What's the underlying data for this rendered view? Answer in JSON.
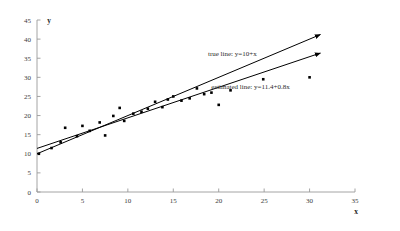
{
  "chart_data": {
    "type": "scatter",
    "title": "",
    "xlabel": "x",
    "ylabel": "y",
    "xlim": [
      0,
      35
    ],
    "ylim": [
      0,
      45
    ],
    "xticks": [
      0,
      5,
      10,
      15,
      20,
      25,
      30,
      35
    ],
    "yticks": [
      0,
      5,
      10,
      15,
      20,
      25,
      30,
      35,
      40,
      45
    ],
    "grid": false,
    "legend_position": "inline-annotations",
    "annotations": [
      {
        "name": "true-line-label",
        "text": "true line: y=10+x",
        "x": 21.5,
        "y": 35.5
      },
      {
        "name": "estimated-line-label",
        "text": "estimated line: y=11.4+0.8x",
        "x": 23.5,
        "y": 27.0
      }
    ],
    "series": [
      {
        "name": "observations",
        "type": "scatter",
        "marker": "square",
        "color": "#000000",
        "points": [
          [
            0.2,
            10.0
          ],
          [
            1.6,
            11.5
          ],
          [
            2.6,
            13.0
          ],
          [
            3.1,
            16.8
          ],
          [
            4.4,
            14.6
          ],
          [
            5.0,
            17.3
          ],
          [
            5.8,
            16.0
          ],
          [
            6.9,
            18.2
          ],
          [
            7.5,
            14.8
          ],
          [
            8.4,
            19.9
          ],
          [
            9.1,
            22.0
          ],
          [
            9.6,
            18.6
          ],
          [
            10.6,
            20.5
          ],
          [
            11.5,
            21.0
          ],
          [
            12.2,
            21.8
          ],
          [
            13.0,
            23.6
          ],
          [
            13.8,
            22.2
          ],
          [
            14.4,
            24.2
          ],
          [
            15.0,
            25.0
          ],
          [
            15.9,
            23.9
          ],
          [
            16.8,
            24.5
          ],
          [
            17.6,
            27.1
          ],
          [
            18.4,
            25.6
          ],
          [
            19.2,
            26.0
          ],
          [
            20.0,
            22.8
          ],
          [
            21.3,
            26.6
          ],
          [
            24.9,
            29.5
          ],
          [
            30.0,
            30.0
          ]
        ]
      },
      {
        "name": "true line",
        "type": "line",
        "equation": "y=10+x",
        "intercept": 10,
        "slope": 1,
        "color": "#000000",
        "x_range": [
          0,
          31.2
        ],
        "arrow": true
      },
      {
        "name": "estimated line",
        "type": "line",
        "equation": "y=11.4+0.8x",
        "intercept": 11.4,
        "slope": 0.8,
        "color": "#000000",
        "x_range": [
          0,
          31.2
        ],
        "arrow": true
      }
    ]
  }
}
